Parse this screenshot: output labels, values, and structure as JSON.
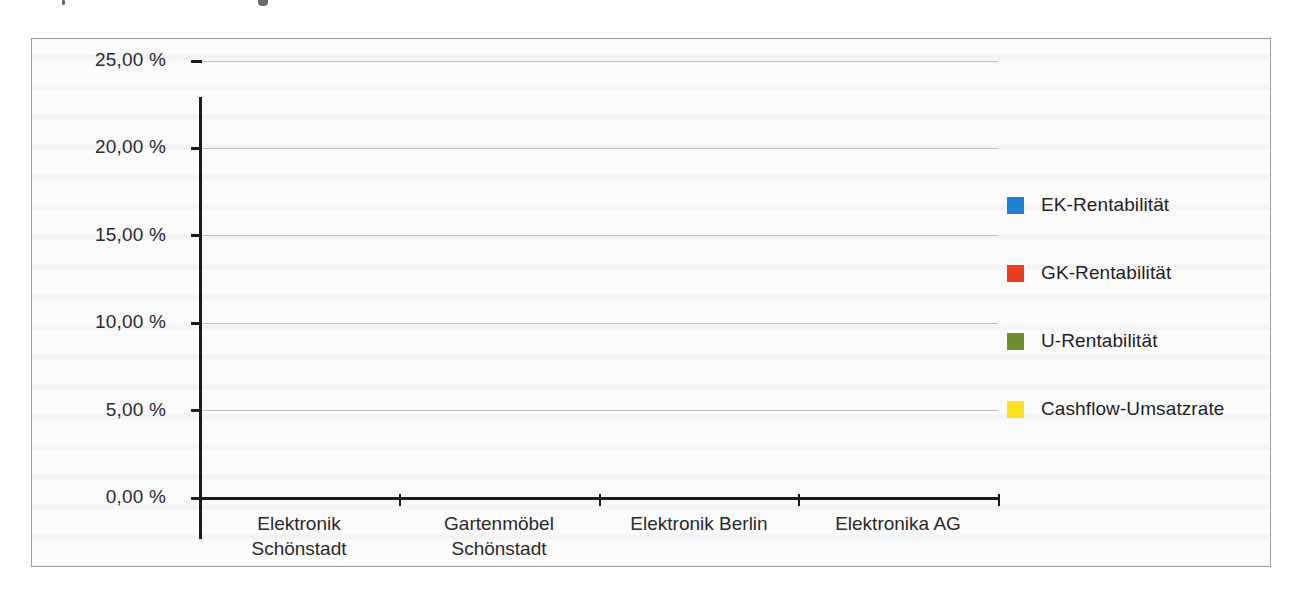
{
  "figure": {
    "frame_border_color": "#9aa0a3",
    "background_color": "#fbfbfc"
  },
  "chart_data": {
    "type": "bar",
    "title": "",
    "subtitle": "",
    "xlabel": "",
    "ylabel": "",
    "grid": true,
    "legend_position": "right",
    "ylim": [
      0,
      25
    ],
    "ytick_labels": [
      "25,00 %",
      "20,00 %",
      "15,00 %",
      "10,00 %",
      "5,00 %",
      "0,00 %"
    ],
    "ytick_values": [
      25,
      20,
      15,
      10,
      5,
      0
    ],
    "categories": [
      "Elektronik\nSchönstadt",
      "Gartenmöbel\nSchönstadt",
      "Elektronik Berlin",
      "Elektronika AG"
    ],
    "series": [
      {
        "name": "EK-Rentabilität",
        "color": "#1f7fd0",
        "values": [
          0,
          0,
          0,
          0
        ]
      },
      {
        "name": "GK-Rentabilität",
        "color": "#e8401f",
        "values": [
          0,
          0,
          0,
          0
        ]
      },
      {
        "name": "U-Rentabilität",
        "color": "#6f8f2f",
        "values": [
          0,
          0,
          0,
          0
        ]
      },
      {
        "name": "Cashflow-Umsatzrate",
        "color": "#fbe322",
        "values": [
          0,
          0,
          0,
          0
        ]
      }
    ]
  }
}
